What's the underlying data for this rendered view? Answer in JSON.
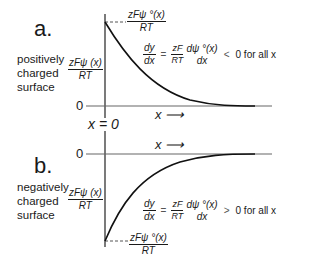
{
  "panels": {
    "a": {
      "label": "a.",
      "surface_description": "positively charged surface",
      "y_label": {
        "num": "zFψ (x)",
        "den": "RT"
      },
      "peak_label": {
        "num": "zFψ °(x)",
        "den": "RT"
      },
      "zero_label": "0",
      "x_axis_label": "x ⟶",
      "equation": {
        "lhs": {
          "num": "dy",
          "den": "dx"
        },
        "equals": "=",
        "coef": {
          "num": "zF",
          "den": "RT"
        },
        "deriv": {
          "num": "dψ °(x)",
          "den": "dx"
        },
        "relation": "<",
        "rhs": "0 for all x"
      }
    },
    "b": {
      "label": "b.",
      "surface_description": "negatively charged surface",
      "y_label": {
        "num": "zFψ (x)",
        "den": "RT"
      },
      "trough_label": {
        "num": "zFψ °(x)",
        "den": "RT"
      },
      "zero_label": "0",
      "x_axis_label": "x ⟶",
      "equation": {
        "lhs": {
          "num": "dy",
          "den": "dx"
        },
        "equals": "=",
        "coef": {
          "num": "zF",
          "den": "RT"
        },
        "deriv": {
          "num": "dψ °(x)",
          "den": "dx"
        },
        "relation": ">",
        "rhs": "0 for all x"
      }
    },
    "origin_label": "x = 0"
  },
  "colors": {
    "curve": "#1a1a1a",
    "axis": "#555555",
    "text": "#1a1a1a"
  }
}
